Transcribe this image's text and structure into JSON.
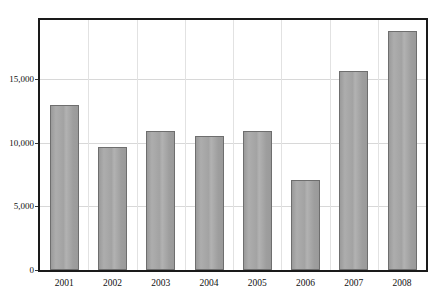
{
  "chart_data": {
    "type": "bar",
    "title": "",
    "subtitle": "",
    "xlabel": "",
    "ylabel": "",
    "categories": [
      "2001",
      "2002",
      "2003",
      "2004",
      "2005",
      "2006",
      "2007",
      "2008"
    ],
    "values": [
      12950,
      9650,
      10950,
      10550,
      10950,
      7050,
      15650,
      18800
    ],
    "series": [
      {
        "name": "",
        "values": [
          12950,
          9650,
          10950,
          10550,
          10950,
          7050,
          15650,
          18800
        ]
      }
    ],
    "ylim": [
      0,
      19650
    ],
    "ytick_values": [
      0,
      5000,
      10000,
      15000
    ],
    "ytick_labels": [
      "0",
      "5,000",
      "10,000",
      "15,000"
    ],
    "xtick_labels": [
      "2001",
      "2002",
      "2003",
      "2004",
      "2005",
      "2006",
      "2007",
      "2008"
    ],
    "grid": "horizontal-and-vertical",
    "legend": "none",
    "legend_position": "none",
    "bar_color": "#a3a3a3",
    "bar_border_color": "#6e6e6e",
    "gridline_color": "#d8d8d8",
    "axis_color": "#1a1a1a",
    "background_color": "#ffffff",
    "text_color": "#111111",
    "annotations": []
  }
}
